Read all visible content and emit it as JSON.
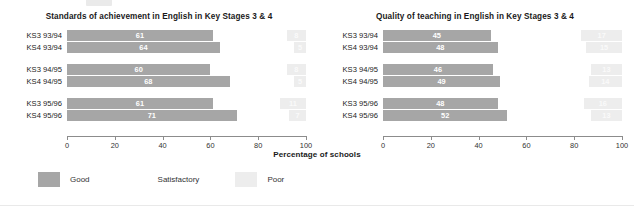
{
  "axis_caption": "Percentage of schools",
  "legend": {
    "items": [
      {
        "label": "Good",
        "color": "#a6a6a6",
        "key": "good"
      },
      {
        "label": "Satisfactory",
        "color": "#ffffff",
        "key": "satisfactory"
      },
      {
        "label": "Poor",
        "color": "#ededed",
        "key": "poor"
      }
    ]
  },
  "axis": {
    "ticks": [
      "0",
      "20",
      "40",
      "60",
      "80",
      "100"
    ],
    "min": 0,
    "max": 100
  },
  "chart_data": [
    {
      "type": "bar",
      "orientation": "horizontal",
      "stacked": true,
      "title": "Standards of achievement in English in Key Stages 3 & 4",
      "xlabel": "Percentage of schools",
      "ylabel": "",
      "xlim": [
        0,
        100
      ],
      "xticks": [
        0,
        20,
        40,
        60,
        80,
        100
      ],
      "grid": false,
      "legend_position": "bottom",
      "categories": [
        "KS3 93/94",
        "KS4 93/94",
        "KS3 94/95",
        "KS4 94/95",
        "KS3 95/96",
        "KS4 95/96"
      ],
      "series": [
        {
          "name": "Good",
          "color": "#a6a6a6",
          "values": [
            61,
            64,
            60,
            68,
            61,
            71
          ]
        },
        {
          "name": "Satisfactory",
          "color": "#ffffff",
          "values": [
            31,
            31,
            32,
            27,
            28,
            22
          ]
        },
        {
          "name": "Poor",
          "color": "#ededed",
          "values": [
            8,
            5,
            8,
            5,
            11,
            7
          ]
        }
      ],
      "bar_labels": {
        "good": [
          "61",
          "64",
          "60",
          "68",
          "61",
          "71"
        ],
        "poor": [
          "8",
          "5",
          "8",
          "5",
          "11",
          "7"
        ]
      }
    },
    {
      "type": "bar",
      "orientation": "horizontal",
      "stacked": true,
      "title": "Quality of teaching in English in Key Stages 3 & 4",
      "xlabel": "Percentage of schools",
      "ylabel": "",
      "xlim": [
        0,
        100
      ],
      "xticks": [
        0,
        20,
        40,
        60,
        80,
        100
      ],
      "grid": false,
      "legend_position": "bottom",
      "categories": [
        "KS3 93/94",
        "KS4 93/94",
        "KS3 94/95",
        "KS4 94/95",
        "KS3 95/96",
        "KS4 95/96"
      ],
      "series": [
        {
          "name": "Good",
          "color": "#a6a6a6",
          "values": [
            45,
            48,
            46,
            49,
            48,
            52
          ]
        },
        {
          "name": "Satisfactory",
          "color": "#ffffff",
          "values": [
            38,
            37,
            41,
            37,
            36,
            35
          ]
        },
        {
          "name": "Poor",
          "color": "#ededed",
          "values": [
            17,
            15,
            13,
            14,
            16,
            13
          ]
        }
      ],
      "bar_labels": {
        "good": [
          "45",
          "48",
          "46",
          "49",
          "48",
          "52"
        ],
        "poor": [
          "17",
          "15",
          "13",
          "14",
          "16",
          "13"
        ]
      }
    }
  ]
}
